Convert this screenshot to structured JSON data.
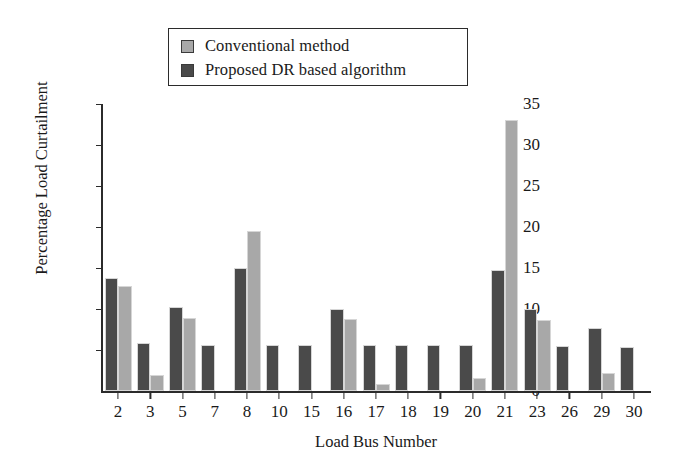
{
  "legend": {
    "items": [
      {
        "label": "Conventional method",
        "color": "#a8a8a8",
        "series": "conventional"
      },
      {
        "label": "Proposed DR based algorithm",
        "color": "#4a4a4a",
        "series": "proposed"
      }
    ]
  },
  "axes": {
    "y_title": "Percentage Load Curtailment",
    "x_title": "Load Bus Number",
    "y_ticks": [
      "0",
      "5",
      "10",
      "15",
      "20",
      "25",
      "30",
      "35"
    ]
  },
  "chart_data": {
    "type": "bar",
    "title": "",
    "xlabel": "Load Bus Number",
    "ylabel": "Percentage Load Curtailment",
    "categories": [
      "2",
      "3",
      "5",
      "7",
      "8",
      "10",
      "15",
      "16",
      "17",
      "18",
      "19",
      "20",
      "21",
      "23",
      "26",
      "29",
      "30"
    ],
    "series": [
      {
        "name": "Proposed DR based algorithm",
        "color": "#4a4a4a",
        "values": [
          13.8,
          5.8,
          10.3,
          5.6,
          15.0,
          5.6,
          5.6,
          10.0,
          5.6,
          5.6,
          5.6,
          5.6,
          14.8,
          10.0,
          5.5,
          7.7,
          5.4
        ]
      },
      {
        "name": "Conventional method",
        "color": "#a8a8a8",
        "values": [
          12.8,
          2.0,
          8.9,
          0,
          19.5,
          0,
          0,
          8.8,
          0.9,
          0,
          0,
          1.6,
          33.0,
          8.6,
          0,
          2.2,
          0
        ]
      }
    ],
    "ylim": [
      0,
      35
    ],
    "ytick_step": 5,
    "grid": false,
    "legend_position": "top-center"
  }
}
